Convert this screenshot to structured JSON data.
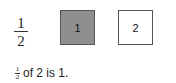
{
  "fraction": {
    "numerator": "1",
    "denominator": "2"
  },
  "boxes": [
    {
      "label": "1",
      "shaded": true,
      "color": "#8f8f8f"
    },
    {
      "label": "2",
      "shaded": false,
      "color": "#ffffff"
    }
  ],
  "caption": {
    "fraction_numerator": "1",
    "fraction_denominator": "2",
    "text": "of 2 is 1."
  }
}
